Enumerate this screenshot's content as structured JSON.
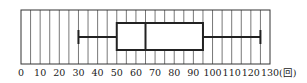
{
  "chart_data": {
    "type": "boxplot",
    "title": "",
    "xlabel": "",
    "ylabel": "",
    "unit_label": "(回)",
    "xlim": [
      0,
      130
    ],
    "grid": {
      "vertical": true,
      "step": 5
    },
    "ticks": [
      0,
      10,
      20,
      30,
      40,
      50,
      60,
      70,
      80,
      90,
      100,
      110,
      120,
      130
    ],
    "tick_labels": [
      "0",
      "10",
      "20",
      "30",
      "40",
      "50",
      "60",
      "70",
      "80",
      "90",
      "100",
      "110",
      "120",
      "130"
    ],
    "series": [
      {
        "name": "",
        "min": 30,
        "q1": 50,
        "median": 65,
        "q3": 95,
        "max": 125
      }
    ]
  },
  "colors": {
    "grid": "#555555",
    "box": "#222222",
    "background": "#ffffff"
  }
}
